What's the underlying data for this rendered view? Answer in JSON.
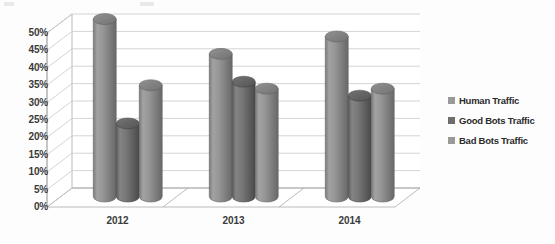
{
  "chart_data": {
    "type": "bar",
    "title": "",
    "subtitle": "",
    "xlabel": "",
    "ylabel": "",
    "categories": [
      "2012",
      "2013",
      "2014"
    ],
    "series": [
      {
        "name": "Human Traffic",
        "values": [
          51,
          41,
          46
        ],
        "color": "#8c8c8c"
      },
      {
        "name": "Good Bots Traffic",
        "values": [
          21,
          33,
          29
        ],
        "color": "#6e6e6e"
      },
      {
        "name": "Bad Bots Traffic",
        "values": [
          32,
          31,
          31
        ],
        "color": "#8c8c8c"
      }
    ],
    "ylim": [
      0,
      50
    ],
    "yticks": [
      "0%",
      "5%",
      "10%",
      "15%",
      "20%",
      "25%",
      "30%",
      "35%",
      "40%",
      "45%",
      "50%"
    ],
    "ytick_values": [
      0,
      5,
      10,
      15,
      20,
      25,
      30,
      35,
      40,
      45,
      50
    ],
    "value_suffix": "%",
    "grid": true,
    "grid_axis": "y",
    "legend_position": "right",
    "style": "3d-cylinder",
    "plot_background": "#ffffff",
    "grid_color": "#c9c9c9",
    "axis_color": "#a9a9a9"
  },
  "legend": {
    "items": [
      {
        "label": "Human Traffic",
        "swatch": "#9a9a9a"
      },
      {
        "label": "Good Bots Traffic",
        "swatch": "#6e6e6e"
      },
      {
        "label": "Bad Bots Traffic",
        "swatch": "#9a9a9a"
      }
    ]
  }
}
